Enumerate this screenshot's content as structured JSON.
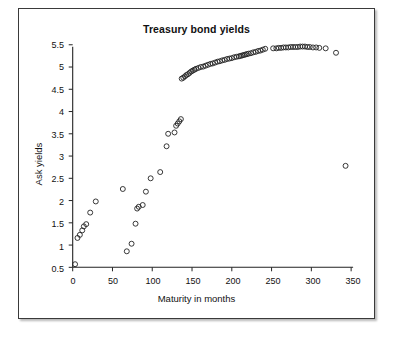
{
  "chart_data": {
    "type": "scatter",
    "title": "Treasury bond yields",
    "xlabel": "Maturity in months",
    "ylabel": "Ask yields",
    "xlim": [
      0,
      350
    ],
    "ylim": [
      0.5,
      5.5
    ],
    "xticks": [
      0,
      50,
      100,
      150,
      200,
      250,
      300,
      350
    ],
    "yticks": [
      0.5,
      1,
      1.5,
      2,
      2.5,
      3,
      3.5,
      4,
      4.5,
      5,
      5.5
    ],
    "grid": false,
    "legend": null,
    "marker": "open-circle",
    "marker_color": "#222222",
    "series": [
      {
        "name": "Ask yields",
        "x": [
          3,
          6,
          9,
          12,
          14,
          17,
          22,
          29,
          63,
          68,
          74,
          79,
          81,
          83,
          88,
          92,
          98,
          110,
          118,
          120,
          128,
          130,
          132,
          134,
          136,
          137,
          139,
          141,
          143,
          145,
          147,
          149,
          151,
          153,
          155,
          158,
          161,
          164,
          167,
          170,
          173,
          176,
          179,
          182,
          185,
          188,
          191,
          194,
          197,
          200,
          203,
          206,
          209,
          211,
          213,
          215,
          217,
          219,
          221,
          224,
          227,
          230,
          233,
          236,
          239,
          242,
          252,
          256,
          259,
          262,
          265,
          268,
          271,
          274,
          277,
          280,
          283,
          286,
          289,
          292,
          295,
          298,
          302,
          306,
          310,
          318,
          331,
          343
        ],
        "y": [
          0.57,
          1.16,
          1.23,
          1.33,
          1.42,
          1.47,
          1.73,
          1.98,
          2.26,
          0.86,
          1.03,
          1.48,
          1.82,
          1.86,
          1.9,
          2.2,
          2.5,
          2.64,
          3.22,
          3.5,
          3.53,
          3.68,
          3.73,
          3.78,
          3.83,
          4.74,
          4.76,
          4.79,
          4.82,
          4.84,
          4.87,
          4.9,
          4.92,
          4.94,
          4.96,
          4.98,
          5.0,
          5.01,
          5.03,
          5.05,
          5.07,
          5.08,
          5.1,
          5.12,
          5.13,
          5.15,
          5.16,
          5.18,
          5.19,
          5.2,
          5.22,
          5.23,
          5.24,
          5.25,
          5.26,
          5.27,
          5.28,
          5.29,
          5.3,
          5.31,
          5.33,
          5.34,
          5.36,
          5.37,
          5.39,
          5.41,
          5.42,
          5.42,
          5.43,
          5.43,
          5.44,
          5.44,
          5.44,
          5.45,
          5.45,
          5.45,
          5.45,
          5.46,
          5.46,
          5.46,
          5.45,
          5.45,
          5.44,
          5.44,
          5.43,
          5.42,
          5.32,
          2.78
        ]
      }
    ]
  }
}
